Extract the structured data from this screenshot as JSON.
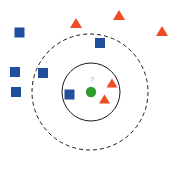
{
  "figure": {
    "width": 179,
    "height": 172,
    "background_color": "#ffffff"
  },
  "colors": {
    "class_a_blue": "#1f4e9c",
    "class_b_orange": "#f04c23",
    "query_green": "#2e9b2e",
    "circle_stroke": "#1a1a1a",
    "query_label_color": "#8fa3c8"
  },
  "query_point": {
    "label": "?",
    "shape": "circle",
    "color": "#2e9b2e",
    "cx": 91,
    "cy": 92,
    "r": 5.2,
    "label_x": 92,
    "label_y": 82
  },
  "boundaries": [
    {
      "name": "inner-neighborhood-circle",
      "style": "solid",
      "cx": 91,
      "cy": 92,
      "r": 29,
      "stroke": "#1a1a1a",
      "stroke_width": 1
    },
    {
      "name": "outer-neighborhood-circle",
      "style": "dashed",
      "cx": 90,
      "cy": 92,
      "r": 58,
      "stroke": "#1a1a1a",
      "stroke_width": 1,
      "dash_pattern": "4 3"
    }
  ],
  "points": [
    {
      "id": "square-1",
      "shape": "square",
      "class": "blue",
      "color": "#1f4e9c",
      "x": 19.5,
      "y": 32.5,
      "size": 10
    },
    {
      "id": "square-2",
      "shape": "square",
      "class": "blue",
      "color": "#1f4e9c",
      "x": 15.0,
      "y": 72.0,
      "size": 10
    },
    {
      "id": "square-3",
      "shape": "square",
      "class": "blue",
      "color": "#1f4e9c",
      "x": 16.0,
      "y": 92.0,
      "size": 10
    },
    {
      "id": "square-4",
      "shape": "square",
      "class": "blue",
      "color": "#1f4e9c",
      "x": 43.0,
      "y": 73.0,
      "size": 10
    },
    {
      "id": "square-5",
      "shape": "square",
      "class": "blue",
      "color": "#1f4e9c",
      "x": 69.5,
      "y": 94.5,
      "size": 10
    },
    {
      "id": "square-6",
      "shape": "square",
      "class": "blue",
      "color": "#1f4e9c",
      "x": 100.0,
      "y": 43.0,
      "size": 10
    },
    {
      "id": "triangle-1",
      "shape": "triangle",
      "class": "orange",
      "color": "#f04c23",
      "x": 76.0,
      "y": 23.0,
      "size": 12
    },
    {
      "id": "triangle-2",
      "shape": "triangle",
      "class": "orange",
      "color": "#f04c23",
      "x": 119.0,
      "y": 15.0,
      "size": 12
    },
    {
      "id": "triangle-3",
      "shape": "triangle",
      "class": "orange",
      "color": "#f04c23",
      "x": 162.0,
      "y": 31.0,
      "size": 12
    },
    {
      "id": "triangle-4",
      "shape": "triangle",
      "class": "orange",
      "color": "#f04c23",
      "x": 112.0,
      "y": 83.0,
      "size": 11
    },
    {
      "id": "triangle-5",
      "shape": "triangle",
      "class": "orange",
      "color": "#f04c23",
      "x": 104.5,
      "y": 99.0,
      "size": 11
    }
  ],
  "chart_data": {
    "type": "scatter",
    "xlabel": "",
    "ylabel": "",
    "xlim": [
      0,
      179
    ],
    "ylim": [
      0,
      172
    ],
    "grid": false,
    "legend": "none",
    "note": "Coordinates are in screen pixels; y increases downward.",
    "series": [
      {
        "name": "Class A (blue squares)",
        "marker": "square",
        "color": "#1f4e9c",
        "points": [
          [
            19.5,
            32.5
          ],
          [
            15.0,
            72.0
          ],
          [
            16.0,
            92.0
          ],
          [
            43.0,
            73.0
          ],
          [
            69.5,
            94.5
          ],
          [
            100.0,
            43.0
          ]
        ]
      },
      {
        "name": "Class B (orange triangles)",
        "marker": "triangle",
        "color": "#f04c23",
        "points": [
          [
            76.0,
            23.0
          ],
          [
            119.0,
            15.0
          ],
          [
            162.0,
            31.0
          ],
          [
            112.0,
            83.0
          ],
          [
            104.5,
            99.0
          ]
        ]
      },
      {
        "name": "Query point (unknown class)",
        "marker": "circle",
        "color": "#2e9b2e",
        "points": [
          [
            91.0,
            92.0
          ]
        ],
        "annotation": "?"
      }
    ],
    "annotations": [
      {
        "type": "circle",
        "name": "inner-neighborhood-circle",
        "center": [
          91,
          92
        ],
        "radius": 29,
        "linestyle": "solid",
        "color": "#1a1a1a"
      },
      {
        "type": "circle",
        "name": "outer-neighborhood-circle",
        "center": [
          90,
          92
        ],
        "radius": 58,
        "linestyle": "dashed",
        "color": "#1a1a1a"
      },
      {
        "type": "text",
        "name": "query-label",
        "text": "?",
        "position": [
          92,
          82
        ],
        "color": "#8fa3c8"
      }
    ]
  }
}
